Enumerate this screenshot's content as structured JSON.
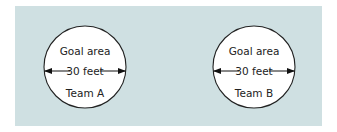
{
  "diagram": {
    "background_color": "#cfe0e2",
    "goals": [
      {
        "label": "Goal area",
        "dimension": "30 feet",
        "team": "Team A"
      },
      {
        "label": "Goal area",
        "dimension": "30 feet",
        "team": "Team B"
      }
    ]
  }
}
